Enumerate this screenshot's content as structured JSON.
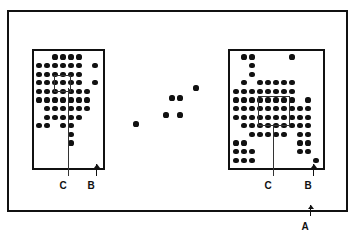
{
  "figure": {
    "type": "technical-diagram",
    "background_color": "#ffffff",
    "ink_color": "#111111",
    "width": 356,
    "height": 235
  },
  "outer_frame": {
    "name": "A",
    "x": 7,
    "y": 10,
    "width": 341,
    "height": 202,
    "border_width": 2
  },
  "labels": [
    {
      "text": "A",
      "x": 305,
      "y": 222,
      "callout": "outer-frame"
    },
    {
      "text": "C",
      "x": 63,
      "y": 181,
      "callout": "left-inner-box"
    },
    {
      "text": "B",
      "x": 91,
      "y": 181,
      "callout": "left-cluster-box"
    },
    {
      "text": "C",
      "x": 268,
      "y": 181,
      "callout": "right-inner-box"
    },
    {
      "text": "B",
      "x": 308,
      "y": 181,
      "callout": "right-cluster-box"
    }
  ],
  "arrows": [
    {
      "name": "arrow-a",
      "x": 310,
      "y_top": 205,
      "y_bottom": 216,
      "direction": "up"
    },
    {
      "name": "arrow-b-left",
      "x": 96,
      "y_top": 164,
      "y_bottom": 176,
      "direction": "up"
    },
    {
      "name": "arrow-b-right",
      "x": 313,
      "y_top": 164,
      "y_bottom": 176,
      "direction": "up"
    }
  ],
  "leaders": [
    {
      "name": "leader-c-left",
      "x": 68,
      "y_top": 88,
      "y_bottom": 176
    },
    {
      "name": "leader-c-right",
      "x": 273,
      "y_top": 126,
      "y_bottom": 176
    }
  ],
  "clusters": [
    {
      "name": "left-cluster",
      "box": {
        "x": 32,
        "y": 49,
        "width": 73,
        "height": 121
      },
      "dot_radius": 2.6,
      "grid_origin_x": 39,
      "grid_origin_y": 57,
      "grid_step_x": 8.0,
      "grid_step_y": 8.6,
      "inner_box": {
        "x": 54,
        "y": 75,
        "width": 17,
        "height": 17
      },
      "rows": [
        {
          "y_index": 0,
          "cols": [
            2,
            3,
            4,
            5
          ]
        },
        {
          "y_index": 1,
          "cols": [
            0,
            1,
            2,
            3,
            4,
            5,
            7
          ]
        },
        {
          "y_index": 2,
          "cols": [
            0,
            1,
            2,
            3,
            4,
            5
          ]
        },
        {
          "y_index": 3,
          "cols": [
            0,
            1,
            2,
            3,
            4,
            5,
            7
          ]
        },
        {
          "y_index": 4,
          "cols": [
            0,
            1,
            2,
            3,
            4,
            5,
            6
          ]
        },
        {
          "y_index": 5,
          "cols": [
            0,
            1,
            2,
            3,
            4,
            5,
            6
          ]
        },
        {
          "y_index": 6,
          "cols": [
            1,
            2,
            3,
            4,
            5,
            6
          ]
        },
        {
          "y_index": 7,
          "cols": [
            1,
            2,
            3,
            4,
            5
          ]
        },
        {
          "y_index": 8,
          "cols": [
            0,
            1,
            3,
            4
          ]
        },
        {
          "y_index": 9,
          "cols": [
            4
          ]
        },
        {
          "y_index": 10,
          "cols": [
            4
          ]
        }
      ],
      "extra_dots": []
    },
    {
      "name": "right-cluster",
      "box": {
        "x": 228,
        "y": 49,
        "width": 97,
        "height": 121
      },
      "dot_radius": 2.6,
      "grid_origin_x": 236,
      "grid_origin_y": 57,
      "grid_step_x": 8.0,
      "grid_step_y": 8.6,
      "inner_box": {
        "x": 258,
        "y": 96,
        "width": 32,
        "height": 30
      },
      "rows": [
        {
          "y_index": 0,
          "cols": [
            1,
            2,
            7
          ]
        },
        {
          "y_index": 1,
          "cols": [
            2
          ]
        },
        {
          "y_index": 2,
          "cols": [
            2
          ]
        },
        {
          "y_index": 3,
          "cols": [
            1,
            3,
            4,
            5,
            6,
            7
          ]
        },
        {
          "y_index": 4,
          "cols": [
            0,
            1,
            2,
            3,
            4,
            5,
            6,
            7
          ]
        },
        {
          "y_index": 5,
          "cols": [
            0,
            1,
            2,
            3,
            4,
            5,
            6,
            7,
            9
          ]
        },
        {
          "y_index": 6,
          "cols": [
            0,
            1,
            2,
            3,
            4,
            5,
            6,
            7,
            8,
            9
          ]
        },
        {
          "y_index": 7,
          "cols": [
            0,
            1,
            2,
            3,
            4,
            5,
            6,
            7,
            8,
            9
          ]
        },
        {
          "y_index": 8,
          "cols": [
            1,
            2,
            3,
            4,
            5,
            6,
            7,
            8,
            9
          ]
        },
        {
          "y_index": 9,
          "cols": [
            2,
            3,
            4,
            5,
            6,
            8,
            9
          ]
        },
        {
          "y_index": 10,
          "cols": [
            0,
            1,
            8,
            9
          ]
        },
        {
          "y_index": 11,
          "cols": [
            0,
            1,
            2,
            8,
            9
          ]
        },
        {
          "y_index": 12,
          "cols": [
            0,
            1,
            2,
            10
          ]
        }
      ],
      "extra_dots": []
    }
  ],
  "scatter_dots": {
    "name": "middle-scatter",
    "dot_radius": 2.6,
    "points": [
      {
        "x": 136,
        "y": 124
      },
      {
        "x": 166,
        "y": 115
      },
      {
        "x": 172,
        "y": 98
      },
      {
        "x": 180,
        "y": 98
      },
      {
        "x": 180,
        "y": 115
      },
      {
        "x": 196,
        "y": 88
      }
    ]
  }
}
